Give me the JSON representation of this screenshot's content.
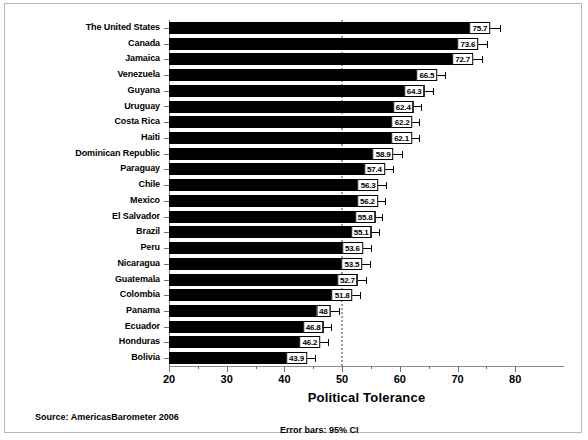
{
  "chart_data": {
    "type": "bar",
    "orientation": "horizontal",
    "title": "",
    "xlabel": "Political Tolerance",
    "ylabel": "",
    "xlim": [
      20,
      81.5
    ],
    "xticks": [
      20,
      30,
      40,
      50,
      60,
      70,
      80
    ],
    "xtick_labels": [
      "20",
      "30",
      "40",
      "50",
      "60",
      "70",
      "80"
    ],
    "minor_xticks": [
      25,
      35,
      45,
      55,
      65,
      75
    ],
    "grid": false,
    "reference_line": 50,
    "legend": "none",
    "categories": [
      "The United States",
      "Canada",
      "Jamaica",
      "Venezuela",
      "Guyana",
      "Uruguay",
      "Costa Rica",
      "Haiti",
      "Dominican Republic",
      "Paraguay",
      "Chile",
      "Mexico",
      "El Salvador",
      "Brazil",
      "Peru",
      "Nicaragua",
      "Guatemala",
      "Colombia",
      "Panama",
      "Ecuador",
      "Honduras",
      "Bolivia"
    ],
    "values": [
      75.7,
      73.6,
      72.7,
      66.5,
      64.3,
      62.4,
      62.2,
      62.1,
      58.9,
      57.4,
      56.3,
      56.2,
      55.8,
      55.1,
      53.6,
      53.5,
      52.7,
      51.8,
      48,
      46.8,
      46.2,
      43.9
    ],
    "value_labels": [
      "75.7",
      "73.6",
      "72.7",
      "66.5",
      "64.3",
      "62.4",
      "62.2",
      "62.1",
      "58.9",
      "57.4",
      "56.3",
      "56.2",
      "55.8",
      "55.1",
      "53.6",
      "53.5",
      "52.7",
      "51.8",
      "48",
      "46.8",
      "46.2",
      "43.9"
    ],
    "error_upper": [
      77.3,
      75.1,
      74.2,
      67.9,
      65.7,
      63.6,
      63.4,
      63.4,
      60.3,
      58.8,
      57.6,
      57.5,
      57.0,
      56.4,
      55.0,
      54.8,
      54.1,
      53.1,
      49.4,
      48.1,
      47.5,
      45.3
    ],
    "error_bar_type": "95% CI"
  },
  "footer": {
    "source": "Source: AmericasBarometer 2006",
    "error_note": "Error bars: 95% CI"
  },
  "axis": {
    "x_title": "Political Tolerance"
  }
}
